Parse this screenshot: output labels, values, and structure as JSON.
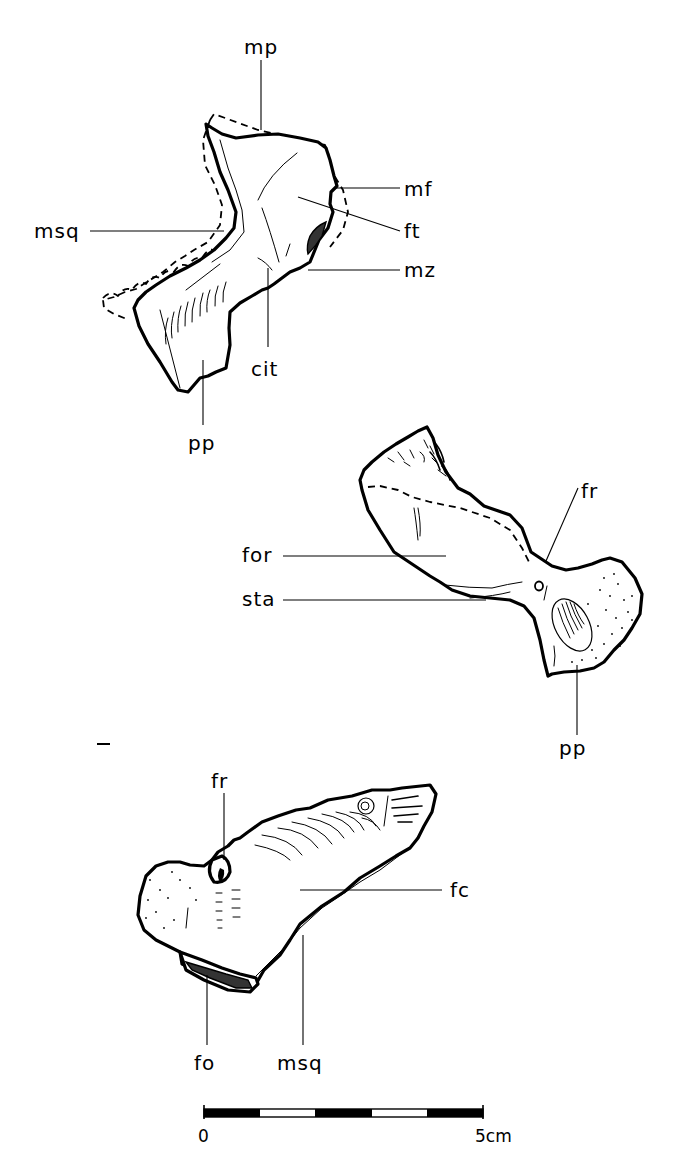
{
  "figure": {
    "type": "anatomical line drawing",
    "views": [
      {
        "id": "upper",
        "labels": [
          {
            "key": "mp",
            "text": "mp"
          },
          {
            "key": "mf",
            "text": "mf"
          },
          {
            "key": "msq",
            "text": "msq"
          },
          {
            "key": "ft",
            "text": "ft"
          },
          {
            "key": "mz",
            "text": "mz"
          },
          {
            "key": "cit",
            "text": "cit"
          },
          {
            "key": "pp",
            "text": "pp"
          }
        ]
      },
      {
        "id": "middle",
        "labels": [
          {
            "key": "fr",
            "text": "fr"
          },
          {
            "key": "for",
            "text": "for"
          },
          {
            "key": "sta",
            "text": "sta"
          },
          {
            "key": "pp",
            "text": "pp"
          }
        ]
      },
      {
        "id": "lower",
        "labels": [
          {
            "key": "fr",
            "text": "fr"
          },
          {
            "key": "fc",
            "text": "fc"
          },
          {
            "key": "fo",
            "text": "fo"
          },
          {
            "key": "msq",
            "text": "msq"
          }
        ]
      }
    ],
    "scale_bar": {
      "start_label": "0",
      "end_label": "5cm",
      "segments": 5,
      "pattern": [
        "black",
        "white",
        "black",
        "white",
        "black"
      ]
    },
    "colors": {
      "ink": "#000000",
      "paper": "#ffffff"
    }
  }
}
